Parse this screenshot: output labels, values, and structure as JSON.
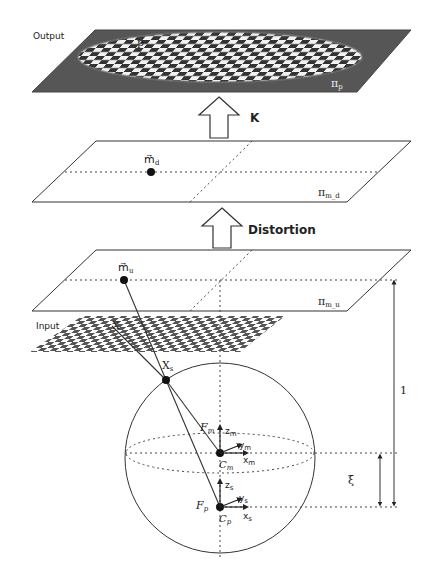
{
  "diagram": {
    "type": "unified-spherical-camera-model",
    "colors": {
      "output_plane": "#565656",
      "line": "#333333",
      "background": "#ffffff"
    },
    "planes": [
      {
        "id": "output",
        "side_label": "Output",
        "symbol": "π",
        "subscript": "p",
        "point_label": "p",
        "description": "image plane with distorted checkerboard"
      },
      {
        "id": "distorted",
        "symbol": "π",
        "subscript": "m_d",
        "point_label": "m⃗",
        "point_sub": "d"
      },
      {
        "id": "undistorted",
        "symbol": "π",
        "subscript": "m_u",
        "point_label": "m⃗",
        "point_sub": "u"
      },
      {
        "id": "input",
        "side_label": "Input",
        "point_label": "X"
      }
    ],
    "arrows": {
      "k": {
        "label": "K"
      },
      "distortion": {
        "label": "Distortion"
      }
    },
    "sphere": {
      "point_on_sphere": {
        "label": "X",
        "sub": "s"
      },
      "frame_m": {
        "frame": "F",
        "frame_sub": "m",
        "center": "C",
        "center_sub": "m",
        "axes": [
          {
            "l": "z",
            "s": "m"
          },
          {
            "l": "y",
            "s": "m"
          },
          {
            "l": "x",
            "s": "m"
          }
        ]
      },
      "frame_p": {
        "frame": "F",
        "frame_sub": "p",
        "center": "C",
        "center_sub": "p",
        "axes": [
          {
            "l": "z",
            "s": "s"
          },
          {
            "l": "y",
            "s": "s"
          },
          {
            "l": "x",
            "s": "s"
          }
        ]
      }
    },
    "dimensions": {
      "unit": "1",
      "xi": "ξ"
    }
  }
}
